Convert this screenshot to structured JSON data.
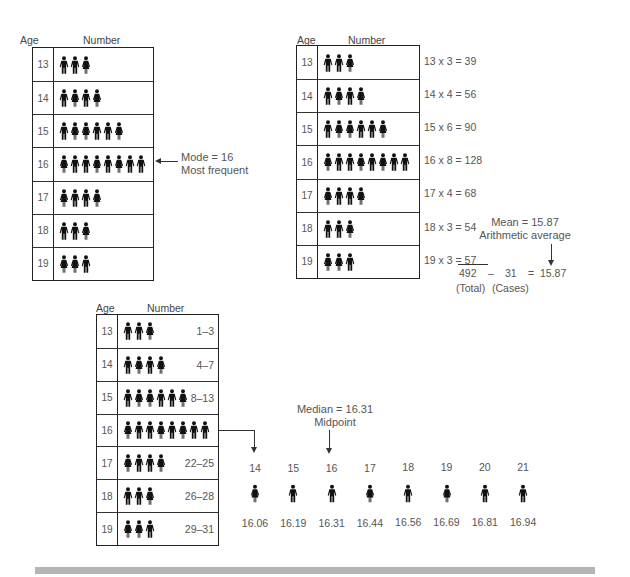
{
  "headers": {
    "age": "Age",
    "number": "Number"
  },
  "icons": {
    "male": "male-figure-icon",
    "female": "female-figure-icon"
  },
  "rows": [
    {
      "age": "13",
      "count": 3,
      "figures": [
        "M",
        "M",
        "F"
      ],
      "calc": "13 x 3 = 39",
      "range": "1–3"
    },
    {
      "age": "14",
      "count": 4,
      "figures": [
        "M",
        "F",
        "M",
        "F"
      ],
      "calc": "14 x 4 = 56",
      "range": "4–7"
    },
    {
      "age": "15",
      "count": 6,
      "figures": [
        "M",
        "F",
        "F",
        "M",
        "M",
        "F"
      ],
      "calc": "15 x 6 = 90",
      "range": "8–13"
    },
    {
      "age": "16",
      "count": 8,
      "figures": [
        "F",
        "M",
        "M",
        "F",
        "M",
        "F",
        "M",
        "M"
      ],
      "calc": "16 x 8 = 128",
      "range": ""
    },
    {
      "age": "17",
      "count": 4,
      "figures": [
        "F",
        "M",
        "M",
        "F"
      ],
      "calc": "17 x 4 = 68",
      "range": "22–25"
    },
    {
      "age": "18",
      "count": 3,
      "figures": [
        "M",
        "M",
        "F"
      ],
      "calc": "18 x 3 = 54",
      "range": "26–28"
    },
    {
      "age": "19",
      "count": 3,
      "figures": [
        "F",
        "F",
        "M"
      ],
      "calc": "19 x 3 = 57",
      "range": "29–31"
    }
  ],
  "mode": {
    "line1": "Mode = 16",
    "line2": "Most frequent"
  },
  "mean": {
    "line1": "Mean = 15.87",
    "line2": "Arithmetic average",
    "total": "492",
    "op": "–",
    "cases": "31",
    "eq": "=",
    "result": "15.87",
    "total_label": "(Total)",
    "cases_label": "(Cases)"
  },
  "median": {
    "line1": "Median = 16.31",
    "line2": "Midpoint",
    "sequence": [
      {
        "pos": "14",
        "figure": "F",
        "value": "16.06"
      },
      {
        "pos": "15",
        "figure": "M",
        "value": "16.19"
      },
      {
        "pos": "16",
        "figure": "M",
        "value": "16.31"
      },
      {
        "pos": "17",
        "figure": "F",
        "value": "16.44"
      },
      {
        "pos": "18",
        "figure": "M",
        "value": "16.56"
      },
      {
        "pos": "19",
        "figure": "F",
        "value": "16.69"
      },
      {
        "pos": "20",
        "figure": "M",
        "value": "16.81"
      },
      {
        "pos": "21",
        "figure": "M",
        "value": "16.94"
      }
    ]
  },
  "chart_data": {
    "type": "table",
    "categories": [
      "13",
      "14",
      "15",
      "16",
      "17",
      "18",
      "19"
    ],
    "values": [
      3,
      4,
      6,
      8,
      4,
      3,
      3
    ],
    "products": [
      39,
      56,
      90,
      128,
      68,
      54,
      57
    ],
    "total": 492,
    "cases": 31,
    "mean": 15.87,
    "mode": 16,
    "median": 16.31
  },
  "colors": {
    "ink": "#222222",
    "text": "#555555",
    "rule": "#b5b5b5"
  }
}
